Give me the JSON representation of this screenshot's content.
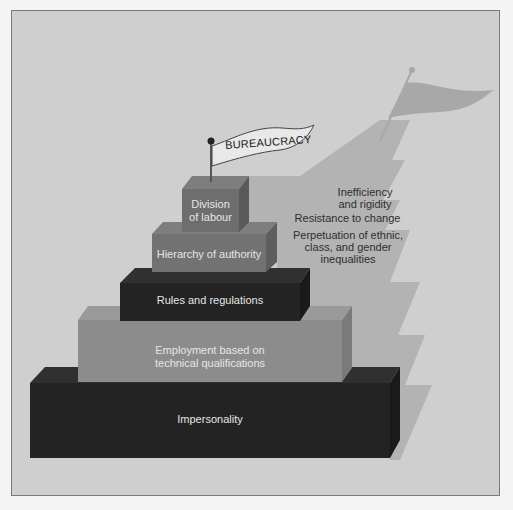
{
  "title": "Bureaucracy",
  "flag_label": "BUREAUCRACY",
  "pyramid_layers": [
    {
      "label_lines": [
        "Division",
        "of labour"
      ],
      "tier": 1
    },
    {
      "label_lines": [
        "Hierarchy of authority"
      ],
      "tier": 2
    },
    {
      "label_lines": [
        "Rules and regulations"
      ],
      "tier": 3
    },
    {
      "label_lines": [
        "Employment based on",
        "technical qualifications"
      ],
      "tier": 4
    },
    {
      "label_lines": [
        "Impersonality"
      ],
      "tier": 5
    }
  ],
  "shadow_consequences": [
    {
      "lines": [
        "Inefficiency",
        "and rigidity"
      ]
    },
    {
      "lines": [
        "Resistance to change"
      ]
    },
    {
      "lines": [
        "Perpetuation of ethnic,",
        "class, and gender",
        "inequalities"
      ]
    }
  ],
  "colors": {
    "panel": "#cfcfcf",
    "dark_block": "#232323",
    "mid_block": "#8a8a8a",
    "shadow": "#b0b0b0",
    "label_text": "#e6e6e6"
  }
}
